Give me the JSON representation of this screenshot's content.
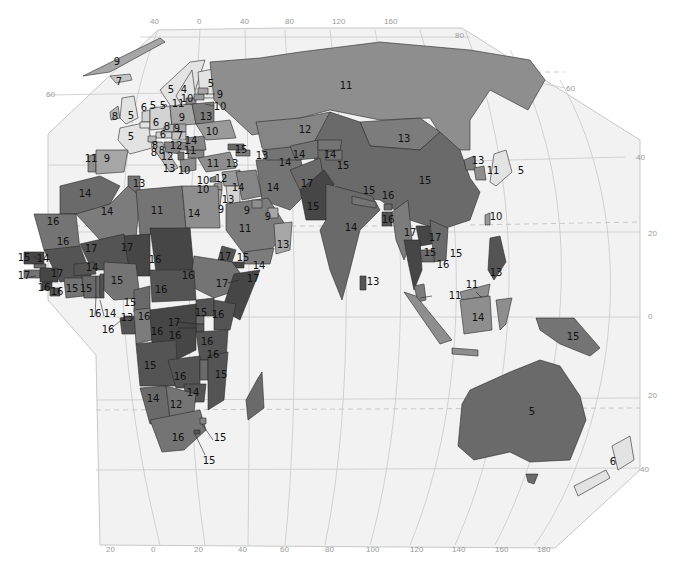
{
  "map": {
    "type": "choropleth",
    "projection": "Eastern Hemisphere (Europe, Africa, Asia, Oceania)",
    "scale_colors": {
      "5": "#e3e3e3",
      "6": "#d2d2d2",
      "7": "#c4c4c4",
      "8": "#b8b8b8",
      "9": "#a6a6a6",
      "10": "#9a9a9a",
      "11": "#8e8e8e",
      "12": "#858585",
      "13": "#7c7c7c",
      "14": "#747474",
      "15": "#6a6a6a",
      "16": "#545454",
      "17": "#464646",
      "4": "#e3e3e3"
    },
    "ocean_color": "#f2f2f2",
    "longitude_ticks_top": [
      "40",
      "0",
      "40",
      "80",
      "120",
      "160"
    ],
    "latitude_ticks_right": [
      "80",
      "60",
      "40",
      "20",
      "0",
      "20",
      "40"
    ],
    "latitude_ticks_left": [
      "60"
    ],
    "longitude_ticks_bottom": [
      "20",
      "0",
      "20",
      "40",
      "60",
      "80",
      "100",
      "120",
      "140",
      "160",
      "180"
    ]
  },
  "regions": [
    {
      "name": "Greenland",
      "value": "9"
    },
    {
      "name": "Iceland",
      "value": "7"
    },
    {
      "name": "Ireland",
      "value": "8"
    },
    {
      "name": "United Kingdom",
      "value": "5"
    },
    {
      "name": "Norway",
      "value": "5"
    },
    {
      "name": "Sweden",
      "value": "4"
    },
    {
      "name": "Finland",
      "value": "5"
    },
    {
      "name": "Denmark",
      "value": "5"
    },
    {
      "name": "Netherlands",
      "value": "6"
    },
    {
      "name": "Belgium",
      "value": "5"
    },
    {
      "name": "France",
      "value": "5"
    },
    {
      "name": "Germany",
      "value": "6"
    },
    {
      "name": "Czechia",
      "value": "8"
    },
    {
      "name": "Slovakia",
      "value": "9"
    },
    {
      "name": "Austria",
      "value": "6"
    },
    {
      "name": "Hungary",
      "value": "8"
    },
    {
      "name": "Switzerland",
      "value": "7"
    },
    {
      "name": "Italy",
      "value": "8"
    },
    {
      "name": "Slovenia",
      "value": "8"
    },
    {
      "name": "Croatia",
      "value": "12"
    },
    {
      "name": "Bosnia",
      "value": "12"
    },
    {
      "name": "Serbia",
      "value": "12"
    },
    {
      "name": "Romania",
      "value": "14"
    },
    {
      "name": "Bulgaria",
      "value": "11"
    },
    {
      "name": "Albania",
      "value": "13"
    },
    {
      "name": "Greece",
      "value": "10"
    },
    {
      "name": "Poland",
      "value": "9"
    },
    {
      "name": "Lithuania",
      "value": "11"
    },
    {
      "name": "Latvia",
      "value": "10"
    },
    {
      "name": "Estonia",
      "value": "9"
    },
    {
      "name": "Estonia-leader",
      "value": "10"
    },
    {
      "name": "Belarus",
      "value": "13"
    },
    {
      "name": "Ukraine",
      "value": "10"
    },
    {
      "name": "Portugal",
      "value": "11"
    },
    {
      "name": "Spain",
      "value": "9"
    },
    {
      "name": "Russia",
      "value": "11"
    },
    {
      "name": "Kazakhstan",
      "value": "12"
    },
    {
      "name": "Mongolia",
      "value": "13"
    },
    {
      "name": "China",
      "value": "15"
    },
    {
      "name": "North Korea",
      "value": "13"
    },
    {
      "name": "South Korea",
      "value": "11"
    },
    {
      "name": "Japan",
      "value": "5"
    },
    {
      "name": "Taiwan",
      "value": "10"
    },
    {
      "name": "Georgia",
      "value": "15"
    },
    {
      "name": "Azerbaijan",
      "value": "13"
    },
    {
      "name": "Turkey",
      "value": "11"
    },
    {
      "name": "Armenia",
      "value": "13"
    },
    {
      "name": "Cyprus",
      "value": "10"
    },
    {
      "name": "Lebanon",
      "value": "10"
    },
    {
      "name": "Syria",
      "value": "12"
    },
    {
      "name": "Iraq",
      "value": "14"
    },
    {
      "name": "Iran",
      "value": "14"
    },
    {
      "name": "Turkmenistan",
      "value": "14"
    },
    {
      "name": "Uzbekistan",
      "value": "14"
    },
    {
      "name": "Kyrgyzstan",
      "value": "14"
    },
    {
      "name": "Tajikistan",
      "value": "15"
    },
    {
      "name": "Afghanistan",
      "value": "17"
    },
    {
      "name": "Pakistan",
      "value": "15"
    },
    {
      "name": "India",
      "value": "14"
    },
    {
      "name": "Nepal",
      "value": "15"
    },
    {
      "name": "Bhutan",
      "value": "16"
    },
    {
      "name": "Bangladesh",
      "value": "16"
    },
    {
      "name": "Sri Lanka",
      "value": "13"
    },
    {
      "name": "Myanmar",
      "value": "17"
    },
    {
      "name": "Laos",
      "value": "17"
    },
    {
      "name": "Thailand",
      "value": "15"
    },
    {
      "name": "Vietnam",
      "value": "15"
    },
    {
      "name": "Cambodia",
      "value": "16"
    },
    {
      "name": "Philippines",
      "value": "13"
    },
    {
      "name": "Malaysia (peninsula)",
      "value": "11"
    },
    {
      "name": "Malaysia (Borneo)",
      "value": "11"
    },
    {
      "name": "Indonesia (Kalimantan)",
      "value": "14"
    },
    {
      "name": "Papua New Guinea",
      "value": "15"
    },
    {
      "name": "Australia",
      "value": "5"
    },
    {
      "name": "New Zealand",
      "value": "6"
    },
    {
      "name": "Jordan",
      "value": "9"
    },
    {
      "name": "Israel",
      "value": "13"
    },
    {
      "name": "Saudi Arabia",
      "value": "11"
    },
    {
      "name": "Kuwait",
      "value": "9"
    },
    {
      "name": "Qatar/UAE",
      "value": "9"
    },
    {
      "name": "Oman",
      "value": "13"
    },
    {
      "name": "Yemen",
      "value": "15"
    },
    {
      "name": "Morocco",
      "value": "14"
    },
    {
      "name": "Tunisia",
      "value": "13"
    },
    {
      "name": "Algeria",
      "value": "14"
    },
    {
      "name": "Libya",
      "value": "11"
    },
    {
      "name": "Egypt",
      "value": "14"
    },
    {
      "name": "Mauritania",
      "value": "16"
    },
    {
      "name": "Mali",
      "value": "16"
    },
    {
      "name": "Niger",
      "value": "17"
    },
    {
      "name": "Chad",
      "value": "17"
    },
    {
      "name": "Sudan",
      "value": "16"
    },
    {
      "name": "Eritrea",
      "value": "17"
    },
    {
      "name": "Djibouti",
      "value": "14"
    },
    {
      "name": "Ethiopia",
      "value": "17"
    },
    {
      "name": "Somalia",
      "value": "17"
    },
    {
      "name": "Senegal",
      "value": "15"
    },
    {
      "name": "Gambia",
      "value": "14"
    },
    {
      "name": "Guinea-Bissau",
      "value": "17"
    },
    {
      "name": "Guinea",
      "value": "17"
    },
    {
      "name": "Sierra Leone",
      "value": "16"
    },
    {
      "name": "Liberia",
      "value": "16"
    },
    {
      "name": "Burkina Faso",
      "value": "14"
    },
    {
      "name": "Cote d'Ivoire",
      "value": "15"
    },
    {
      "name": "Ghana",
      "value": "15"
    },
    {
      "name": "Togo",
      "value": "16"
    },
    {
      "name": "Benin",
      "value": "14"
    },
    {
      "name": "Nigeria",
      "value": "15"
    },
    {
      "name": "Cameroon",
      "value": "15"
    },
    {
      "name": "Equatorial Guinea",
      "value": "16"
    },
    {
      "name": "Gabon",
      "value": "13"
    },
    {
      "name": "Congo",
      "value": "16"
    },
    {
      "name": "Central African Republic",
      "value": "16"
    },
    {
      "name": "Uganda",
      "value": "16"
    },
    {
      "name": "Kenya",
      "value": "15"
    },
    {
      "name": "Rwanda",
      "value": "16"
    },
    {
      "name": "Burundi",
      "value": "17"
    },
    {
      "name": "DR Congo",
      "value": "16"
    },
    {
      "name": "Tanzania",
      "value": "16"
    },
    {
      "name": "Angola",
      "value": "16"
    },
    {
      "name": "Zambia",
      "value": "15"
    },
    {
      "name": "Malawi",
      "value": "16"
    },
    {
      "name": "Mozambique",
      "value": "16"
    },
    {
      "name": "Zimbabwe",
      "value": "15"
    },
    {
      "name": "Namibia",
      "value": "14"
    },
    {
      "name": "Botswana",
      "value": "14"
    },
    {
      "name": "South Africa",
      "value": "12"
    },
    {
      "name": "Swaziland",
      "value": "16"
    },
    {
      "name": "Lesotho",
      "value": "15"
    },
    {
      "name": "Madagascar",
      "value": "15"
    }
  ]
}
